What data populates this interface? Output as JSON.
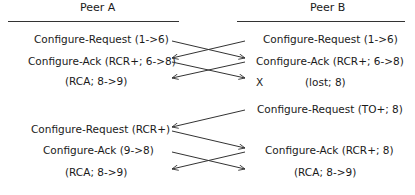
{
  "peer_a": {
    "title": "Peer A",
    "events": [
      "Configure-Request (1->6)",
      "Configure-Ack (RCR+; 6->8)",
      "(RCA; 8->9)",
      "Configure-Request (RCR+)",
      "Configure-Ack (9->8)",
      "(RCA; 8->9)"
    ]
  },
  "peer_b": {
    "title": "Peer B",
    "events": [
      "Configure-Request (1->6)",
      "Configure-Ack (RCR+; 6->8)",
      "X",
      "(lost; 8)",
      "Configure-Request (TO+; 8)",
      "Configure-Ack (RCR+; 8)",
      "(RCA; 8->9)"
    ]
  },
  "colors": {
    "line": "#333333",
    "text": "#1a1a1a"
  }
}
